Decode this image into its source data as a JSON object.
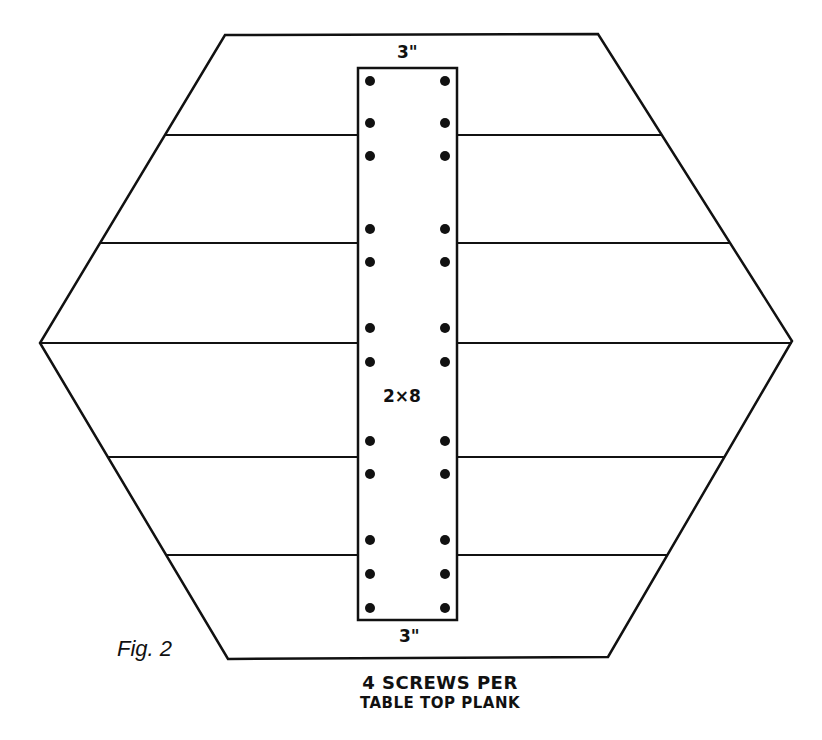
{
  "figure": {
    "label": "Fig. 2",
    "caption_line1": "4 SCREWS PER",
    "caption_line2": "TABLE TOP PLANK",
    "stroke_color": "#111111",
    "background": "#ffffff"
  },
  "board": {
    "size_label": "2×8",
    "top_offset_label": "3\"",
    "bottom_offset_label": "3\"",
    "rect": {
      "x": 358,
      "y": 68,
      "width": 99,
      "height": 552
    }
  },
  "hexagon": {
    "vertices": [
      [
        225,
        35
      ],
      [
        598,
        34
      ],
      [
        792,
        341
      ],
      [
        608,
        657
      ],
      [
        228,
        659
      ],
      [
        40,
        343
      ]
    ]
  },
  "planks": {
    "count": 6,
    "seams": [
      {
        "y": 135,
        "left_x": 165,
        "right_x": 661
      },
      {
        "y": 243,
        "left_x": 100,
        "right_x": 729
      },
      {
        "y": 343,
        "left_x": 40,
        "right_x": 792
      },
      {
        "y": 457,
        "left_x": 108,
        "right_x": 725
      },
      {
        "y": 555,
        "left_x": 167,
        "right_x": 667
      }
    ]
  },
  "screws": {
    "count": 24,
    "left_x": 370,
    "right_x": 445,
    "rows_y": [
      81,
      123,
      156,
      229,
      262,
      328,
      362,
      441,
      474,
      540,
      574,
      608
    ]
  }
}
